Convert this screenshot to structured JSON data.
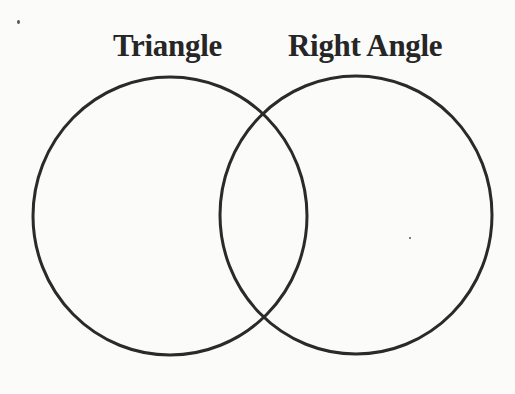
{
  "diagram": {
    "type": "venn",
    "sets": [
      {
        "id": "left",
        "label": "Triangle",
        "cx": 170,
        "cy": 216,
        "rx": 137,
        "ry": 139
      },
      {
        "id": "right",
        "label": "Right Angle",
        "cx": 356,
        "cy": 215,
        "rx": 136,
        "ry": 139
      }
    ],
    "regions": {
      "left_only": "",
      "intersection": "",
      "right_only": ""
    },
    "colors": {
      "stroke": "#2a2a2a",
      "text": "#262626",
      "background": "#fbfbfa"
    },
    "stroke_width": 3
  }
}
